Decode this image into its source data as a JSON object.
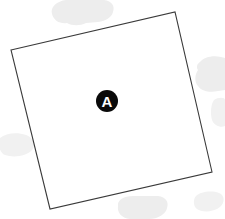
{
  "canvas": {
    "width": 225,
    "height": 219,
    "background_color": "#ffffff"
  },
  "region": {
    "name": "region-a",
    "label": "A",
    "shape": "quadrilateral",
    "fill_color": "#ffffff",
    "stroke_color": "#3a3a3a",
    "stroke_width": 1.1,
    "corners": [
      {
        "name": "top-left",
        "x": 11,
        "y": 50
      },
      {
        "name": "top-right",
        "x": 175,
        "y": 12
      },
      {
        "name": "bottom-right",
        "x": 212,
        "y": 172
      },
      {
        "name": "bottom-left",
        "x": 50,
        "y": 209
      }
    ],
    "points_attr": "11,50 175,12 212,172 50,209"
  },
  "marker": {
    "label": "A",
    "center_x": 107,
    "center_y": 101,
    "radius": 11,
    "disc_color": "#0a0a0a",
    "text_color": "#ffffff"
  },
  "background_blobs": [
    {
      "name": "blob-top",
      "color": "#ededed",
      "path": "M52 14 C50 7 57 1 66 0 L104 0 C112 1 115 6 113 12 C112 17 106 21 98 22 L86 23 C80 26 72 26 67 23 C60 24 54 21 52 14 Z"
    },
    {
      "name": "blob-right",
      "color": "#ededed",
      "path": "M200 62 C204 57 213 55 221 57 L225 58 L225 90 L218 91 C210 93 201 91 198 86 C194 82 195 74 198 70 C196 67 197 64 200 62 Z"
    },
    {
      "name": "blob-left",
      "color": "#f1f1f1",
      "path": "M0 138 C6 133 17 132 26 135 C34 138 36 145 32 150 C27 156 14 158 5 155 C0 153 -2 146 0 138 Z"
    },
    {
      "name": "blob-bottom",
      "color": "#ededed",
      "path": "M118 206 C117 200 124 196 133 196 L158 196 C166 197 169 202 167 208 C166 214 158 219 149 219 L130 219 C121 218 117 212 118 206 Z"
    },
    {
      "name": "blob-right-lower",
      "color": "#f4f4f4",
      "path": "M214 100 C218 97 225 97 225 100 L225 126 C221 128 214 126 212 120 C210 113 211 104 214 100 Z"
    },
    {
      "name": "blob-bottom-right",
      "color": "#f4f4f4",
      "path": "M196 196 C200 192 211 190 219 193 C225 195 225 203 220 207 C214 212 202 213 197 209 C193 206 193 199 196 196 Z"
    }
  ]
}
